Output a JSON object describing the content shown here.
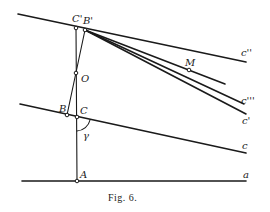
{
  "figure": {
    "caption": "Fig. 6.",
    "points": {
      "C_prime": "C'",
      "B_prime": "B'",
      "O": "O",
      "B": "B",
      "C": "C",
      "A": "A",
      "M": "M"
    },
    "line_labels": {
      "c_double_prime": "c''",
      "c_triple_prime": "c'''",
      "c_prime": "c'",
      "c": "c",
      "a": "a"
    },
    "angle_label": "γ"
  }
}
